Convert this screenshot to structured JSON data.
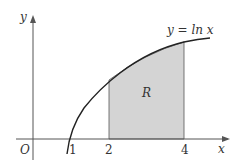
{
  "diagram": {
    "curve_label": "y = ln x",
    "region_label": "R",
    "axes": {
      "x_label": "x",
      "y_label": "y",
      "origin_label": "O"
    },
    "x_ticks": [
      "1",
      "2",
      "4"
    ],
    "region_bounds": {
      "x_from": 2,
      "x_to": 4
    },
    "colors": {
      "region_fill": "#d4d4d4",
      "line": "#222222",
      "axis": "#555555"
    }
  }
}
